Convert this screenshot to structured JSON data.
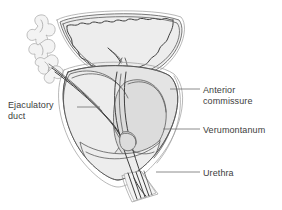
{
  "figure": {
    "type": "anatomical-diagram",
    "background_color": "#ffffff",
    "line_color": "#4a4a4a",
    "text_color": "#3d3d3d",
    "fill_light": "#ededed",
    "fill_mid": "#e2e2e2",
    "fill_dark": "#d6d6d6"
  },
  "labels": {
    "ejaculatory_duct": "Ejaculatory\nduct",
    "anterior_commissure": "Anterior\ncommissure",
    "verumontanum": "Verumontanum",
    "urethra": "Urethra"
  },
  "structures": [
    {
      "name": "bladder",
      "label_ref": null
    },
    {
      "name": "seminal-vesicle",
      "label_ref": null
    },
    {
      "name": "ejaculatory-duct",
      "label_ref": "ejaculatory_duct"
    },
    {
      "name": "anterior-commissure",
      "label_ref": "anterior_commissure"
    },
    {
      "name": "verumontanum",
      "label_ref": "verumontanum"
    },
    {
      "name": "urethra",
      "label_ref": "urethra"
    },
    {
      "name": "prostate-capsule",
      "label_ref": null
    },
    {
      "name": "striated-sphincter",
      "label_ref": null
    }
  ]
}
